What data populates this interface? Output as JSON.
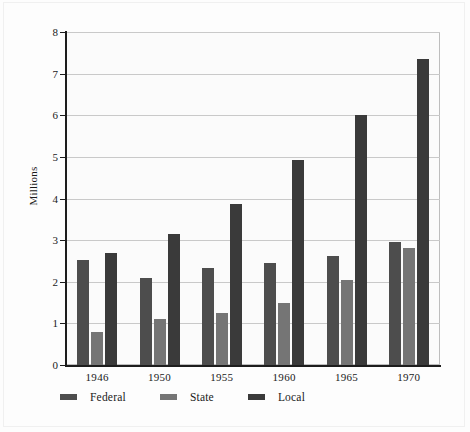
{
  "chart_data": {
    "type": "bar",
    "title": "",
    "xlabel": "",
    "ylabel": "Millions",
    "categories": [
      "1946",
      "1950",
      "1955",
      "1960",
      "1965",
      "1970"
    ],
    "series": [
      {
        "name": "Federal",
        "color": "#4d4d4d",
        "values": [
          2.53,
          2.08,
          2.33,
          2.45,
          2.62,
          2.95
        ]
      },
      {
        "name": "State",
        "color": "#757575",
        "values": [
          0.8,
          1.1,
          1.26,
          1.5,
          2.05,
          2.8
        ]
      },
      {
        "name": "Local",
        "color": "#3a3a3a",
        "values": [
          2.7,
          3.15,
          3.88,
          4.93,
          6.0,
          7.35
        ]
      }
    ],
    "ylim": [
      0,
      8
    ],
    "yticks": [
      0,
      1,
      2,
      3,
      4,
      5,
      6,
      7,
      8
    ],
    "ytick_labels": [
      "0",
      "1",
      "2",
      "3",
      "4",
      "5",
      "6",
      "7",
      "8"
    ],
    "grid": true,
    "legend_position": "bottom"
  },
  "colors": {
    "federal": "#4d4d4d",
    "state": "#757575",
    "local": "#3a3a3a",
    "gridline": "#c9c9c9",
    "axis": "#1d1d1d",
    "plot_background": "#fbfbfb",
    "page_background": "#fdfdfd"
  }
}
